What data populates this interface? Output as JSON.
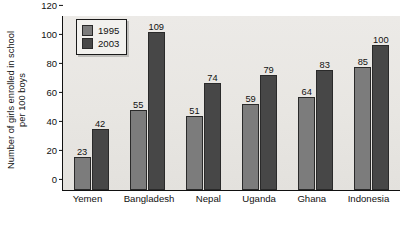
{
  "chart_data": {
    "type": "bar",
    "title": "",
    "xlabel": "",
    "ylabel_line1": "Number of girls enrolled in school",
    "ylabel_line2": "per 100 boys",
    "categories": [
      "Yemen",
      "Bangladesh",
      "Nepal",
      "Uganda",
      "Ghana",
      "Indonesia"
    ],
    "series": [
      {
        "name": "1995",
        "color": "#7c7c7c",
        "values": [
          23,
          55,
          51,
          59,
          64,
          85
        ]
      },
      {
        "name": "2003",
        "color": "#474747",
        "values": [
          42,
          109,
          74,
          79,
          83,
          100
        ]
      }
    ],
    "ylim": [
      0,
      120
    ],
    "yticks": [
      0,
      20,
      40,
      60,
      80,
      100,
      120
    ],
    "grid": false,
    "legend_position": "top-left",
    "data_labels": true
  },
  "legend": {
    "items": [
      {
        "label": "1995"
      },
      {
        "label": "2003"
      }
    ]
  },
  "caption": {
    "text": ""
  }
}
